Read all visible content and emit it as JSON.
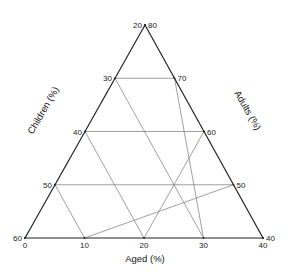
{
  "chart_data": {
    "type": "ternary",
    "title": "",
    "axes": {
      "left": {
        "label": "Children (%)",
        "ticks": [
          20,
          30,
          40,
          50,
          60
        ],
        "range": [
          20,
          60
        ]
      },
      "right": {
        "label": "Adults (%)",
        "ticks": [
          80,
          70,
          60,
          50,
          40
        ],
        "range": [
          40,
          80
        ]
      },
      "bottom": {
        "label": "Aged (%)",
        "ticks": [
          0,
          10,
          20,
          30,
          40
        ],
        "range": [
          0,
          40
        ]
      }
    },
    "grid": true,
    "grid_step": 10
  }
}
